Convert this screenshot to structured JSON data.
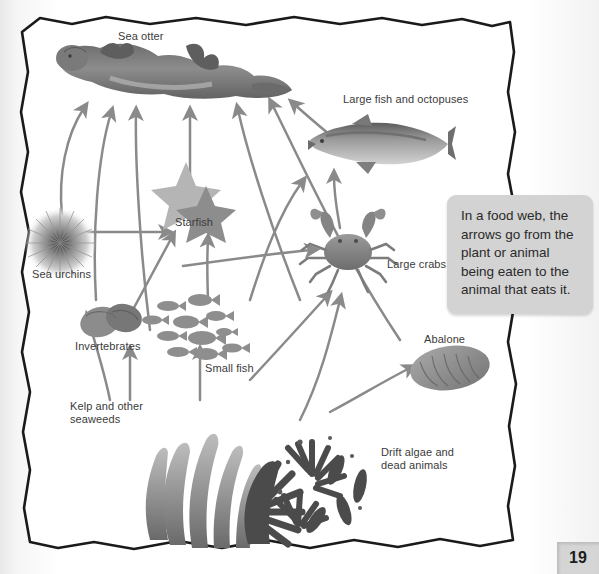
{
  "page": {
    "number": "19",
    "background_color": "#ffffff",
    "border_color": "#1a1a1a"
  },
  "callout": {
    "text": "In a food web, the arrows go from the plant or animal being eaten to the animal that eats it.",
    "background_color": "#d3d3d3"
  },
  "diagram": {
    "arrow_color": "#8a8a8a",
    "label_color": "#3b3b3b",
    "organisms": [
      {
        "id": "sea-otter",
        "label": "Sea otter",
        "label_x": 118,
        "label_y": 36,
        "icon": "sea-otter-illustration"
      },
      {
        "id": "large-fish",
        "label": "Large fish and octopuses",
        "label_x": 343,
        "label_y": 99,
        "icon": "large-fish-illustration"
      },
      {
        "id": "starfish",
        "label": "Starfish",
        "label_x": 175,
        "label_y": 219,
        "icon": "starfish-illustration"
      },
      {
        "id": "large-crabs",
        "label": "Large crabs",
        "label_x": 387,
        "label_y": 261,
        "icon": "crab-illustration"
      },
      {
        "id": "sea-urchins",
        "label": "Sea urchins",
        "label_x": 32,
        "label_y": 271,
        "icon": "sea-urchin-illustration"
      },
      {
        "id": "invertebrates",
        "label": "Invertebrates",
        "label_x": 75,
        "label_y": 344,
        "icon": "invertebrates-illustration"
      },
      {
        "id": "small-fish",
        "label": "Small fish",
        "label_x": 205,
        "label_y": 367,
        "icon": "small-fish-illustration"
      },
      {
        "id": "abalone",
        "label": "Abalone",
        "label_x": 424,
        "label_y": 338,
        "icon": "abalone-illustration"
      },
      {
        "id": "kelp",
        "label": "Kelp and other\nseaweeds",
        "label_x": 70,
        "label_y": 404,
        "icon": "kelp-illustration"
      },
      {
        "id": "drift-algae",
        "label": "Drift algae and\ndead animals",
        "label_x": 381,
        "label_y": 450,
        "icon": "drift-algae-illustration"
      }
    ],
    "edges": [
      {
        "from": "sea-urchins",
        "to": "sea-otter"
      },
      {
        "from": "invertebrates",
        "to": "sea-otter"
      },
      {
        "from": "small-fish",
        "to": "sea-otter"
      },
      {
        "from": "starfish",
        "to": "sea-otter"
      },
      {
        "from": "large-crabs",
        "to": "sea-otter"
      },
      {
        "from": "abalone",
        "to": "sea-otter"
      },
      {
        "from": "sea-urchins",
        "to": "starfish"
      },
      {
        "from": "invertebrates",
        "to": "starfish"
      },
      {
        "from": "small-fish",
        "to": "starfish"
      },
      {
        "from": "small-fish",
        "to": "large-fish"
      },
      {
        "from": "large-crabs",
        "to": "large-fish"
      },
      {
        "from": "invertebrates",
        "to": "large-crabs"
      },
      {
        "from": "small-fish",
        "to": "large-crabs"
      },
      {
        "from": "drift-algae",
        "to": "large-crabs"
      },
      {
        "from": "kelp",
        "to": "invertebrates"
      },
      {
        "from": "kelp",
        "to": "sea-urchins"
      },
      {
        "from": "kelp",
        "to": "small-fish"
      },
      {
        "from": "drift-algae",
        "to": "abalone"
      }
    ]
  }
}
